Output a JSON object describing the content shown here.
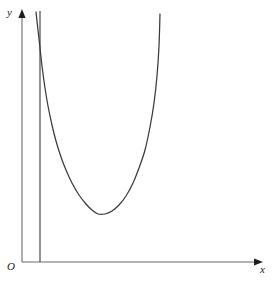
{
  "figure": {
    "kind": "math-graph",
    "background_color": "#ffffff",
    "stroke_color": "#3a3a3a",
    "axis_color": "#555555",
    "width": 274,
    "height": 285
  },
  "labels": {
    "y_axis": "y",
    "x_axis": "x",
    "origin": "O"
  },
  "chart_data": {
    "type": "line",
    "title": "",
    "xlabel": "x",
    "ylabel": "y",
    "grid": false,
    "legend": null,
    "annotations": [
      {
        "name": "origin-label",
        "text": "O",
        "x": 12,
        "y": 268
      },
      {
        "name": "y-axis-label",
        "text": "y",
        "x": 12,
        "y": 14
      },
      {
        "name": "x-axis-label",
        "text": "x",
        "x": 265,
        "y": 271
      }
    ],
    "axes": {
      "y_axis": {
        "x": 22,
        "y_top": 11,
        "y_bottom": 262,
        "arrow": "up"
      },
      "x_axis": {
        "y": 262,
        "x_left": 22,
        "x_right": 263,
        "arrow": "right"
      }
    },
    "asymptote": {
      "name": "vertical-asymptote",
      "x": 40,
      "y_top": 11,
      "y_bottom": 262,
      "style": "solid"
    },
    "series": [
      {
        "name": "curve",
        "description": "U-shaped curve with vertical asymptote; descends steeply from top near x=36, reaches minimum, then rises steeply to the right",
        "points_px": [
          [
            36,
            12
          ],
          [
            38,
            30
          ],
          [
            40,
            48
          ],
          [
            42,
            66
          ],
          [
            45,
            88
          ],
          [
            48,
            106
          ],
          [
            52,
            125
          ],
          [
            56,
            141
          ],
          [
            61,
            157
          ],
          [
            66,
            170
          ],
          [
            72,
            183
          ],
          [
            79,
            195
          ],
          [
            86,
            204
          ],
          [
            92,
            210
          ],
          [
            98,
            214
          ],
          [
            105,
            214
          ],
          [
            112,
            211
          ],
          [
            119,
            205
          ],
          [
            126,
            196
          ],
          [
            133,
            183
          ],
          [
            139,
            168
          ],
          [
            145,
            150
          ],
          [
            150,
            127
          ],
          [
            154,
            103
          ],
          [
            157,
            76
          ],
          [
            159,
            46
          ],
          [
            160,
            14
          ]
        ],
        "minimum_px": [
          98,
          215
        ]
      }
    ],
    "xlim_px": [
      22,
      263
    ],
    "ylim_px": [
      11,
      262
    ]
  }
}
